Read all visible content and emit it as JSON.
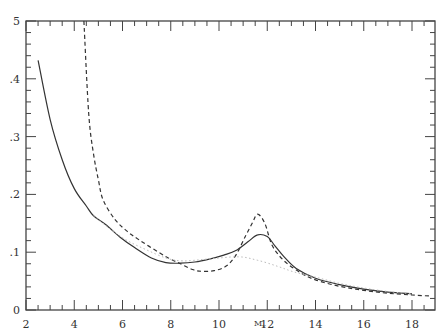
{
  "chart_data": {
    "type": "line",
    "title": "",
    "xlabel": "Mv",
    "ylabel": "",
    "xlim": [
      2,
      19
    ],
    "ylim": [
      0,
      0.5
    ],
    "grid": false,
    "legend": null,
    "x_ticks": [
      2,
      4,
      6,
      8,
      10,
      12,
      14,
      16,
      18
    ],
    "x_tick_labels": [
      "2",
      "4",
      "6",
      "8",
      "10",
      "12",
      "14",
      "16",
      "18"
    ],
    "y_ticks": [
      0,
      0.1,
      0.2,
      0.3,
      0.4,
      0.5
    ],
    "y_tick_labels": [
      "0",
      ".1",
      ".2",
      ".3",
      ".4",
      "5"
    ],
    "series": [
      {
        "name": "solid",
        "style": "solid",
        "color": "#333333",
        "x": [
          2.5,
          3.0,
          3.5,
          4.0,
          4.5,
          4.8,
          5.3,
          5.9,
          6.5,
          7.2,
          7.8,
          8.4,
          9.0,
          9.6,
          10.2,
          10.7,
          11.2,
          11.6,
          12.0,
          12.3,
          12.7,
          13.2,
          14.0,
          15.0,
          16.0,
          17.0,
          18.0
        ],
        "y": [
          0.432,
          0.33,
          0.26,
          0.21,
          0.18,
          0.163,
          0.148,
          0.126,
          0.108,
          0.09,
          0.082,
          0.081,
          0.083,
          0.088,
          0.095,
          0.103,
          0.118,
          0.13,
          0.127,
          0.112,
          0.092,
          0.072,
          0.055,
          0.044,
          0.036,
          0.031,
          0.028
        ]
      },
      {
        "name": "dashed",
        "style": "dashed",
        "color": "#333333",
        "x": [
          4.4,
          4.6,
          4.8,
          5.0,
          5.2,
          5.7,
          6.2,
          6.7,
          7.3,
          7.9,
          8.4,
          8.9,
          9.3,
          9.8,
          10.3,
          10.7,
          11.1,
          11.4,
          11.6,
          11.9,
          12.2,
          12.7,
          13.4,
          14.0,
          15.0,
          16.0,
          17.0,
          18.0,
          18.8
        ],
        "y": [
          0.5,
          0.34,
          0.27,
          0.225,
          0.19,
          0.156,
          0.136,
          0.121,
          0.105,
          0.09,
          0.08,
          0.07,
          0.067,
          0.068,
          0.076,
          0.095,
          0.128,
          0.152,
          0.166,
          0.15,
          0.112,
          0.085,
          0.064,
          0.052,
          0.041,
          0.034,
          0.029,
          0.026,
          0.024
        ]
      },
      {
        "name": "dotted",
        "style": "dotted",
        "color": "#bbbbbb",
        "x": [
          4.8,
          5.5,
          6.2,
          7.0,
          7.8,
          8.5,
          9.5,
          10.8,
          11.6,
          12.4,
          13.1,
          14.0,
          15.0,
          16.0,
          17.0,
          18.0
        ],
        "y": [
          0.163,
          0.14,
          0.12,
          0.104,
          0.09,
          0.085,
          0.088,
          0.092,
          0.086,
          0.076,
          0.066,
          0.057,
          0.046,
          0.038,
          0.032,
          0.028
        ]
      }
    ]
  },
  "axes": {
    "x_label": "M",
    "x_label_sub": "v"
  }
}
